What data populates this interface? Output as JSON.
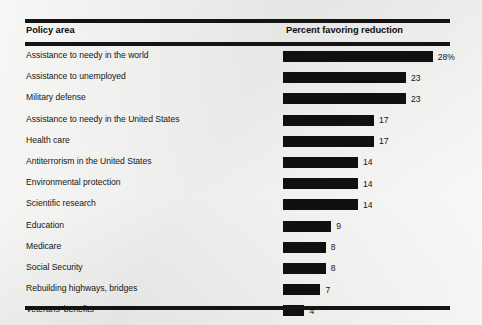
{
  "table": {
    "headers": {
      "policy_area": "Policy area",
      "percent": "Percent favoring reduction"
    }
  },
  "chart_data": {
    "type": "bar",
    "orientation": "horizontal",
    "title": "",
    "xlabel": "Percent favoring reduction",
    "ylabel": "Policy area",
    "xlim": [
      0,
      30
    ],
    "grid": false,
    "legend": null,
    "bar_color": "#101010",
    "background_color": "#f2f2f0",
    "categories": [
      "Assistance to needy in the world",
      "Assistance to unemployed",
      "Military defense",
      "Assistance to needy in the United States",
      "Health care",
      "Antiterrorism in the United States",
      "Environmental protection",
      "Scientific research",
      "Education",
      "Medicare",
      "Social Security",
      "Rebuilding highways, bridges",
      "Veterans' benefits"
    ],
    "values": [
      28,
      23,
      23,
      17,
      17,
      14,
      14,
      14,
      9,
      8,
      8,
      7,
      4
    ],
    "value_labels": [
      "28%",
      "23",
      "23",
      "17",
      "17",
      "14",
      "14",
      "14",
      "9",
      "8",
      "8",
      "7",
      "4"
    ]
  }
}
